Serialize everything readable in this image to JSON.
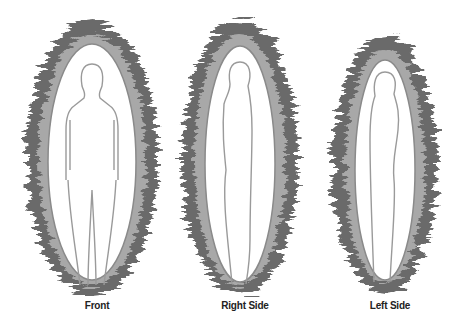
{
  "figures": [
    {
      "label": "Front"
    },
    {
      "label": "Right Side"
    },
    {
      "label": "Left Side"
    }
  ],
  "colors": {
    "aura_dark": "#555555",
    "aura_mid": "#8a8a8a",
    "aura_light": "#bdbdbd",
    "outline": "#9a9a9a",
    "background": "#ffffff"
  }
}
